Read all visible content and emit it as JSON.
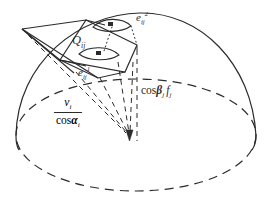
{
  "figure": {
    "background": "#ffffff",
    "stroke": "#2b2b2b",
    "width": 273,
    "height": 202
  },
  "labels": {
    "patch": {
      "base": "Q",
      "sub": "ij",
      "sup": ""
    },
    "element_upper": {
      "base": "e",
      "sub": "ij",
      "sup": "2"
    },
    "element_lower": {
      "base": "e",
      "sub": "ij",
      "sup": "1"
    },
    "flux": {
      "cos": "cos",
      "beta": "β",
      "beta_sub": "j",
      "f": "f",
      "f_sub": "j"
    },
    "fraction": {
      "num": "v",
      "num_sub": "i",
      "den_cos": "cos",
      "den_alpha": "α",
      "den_sub": "i"
    }
  },
  "geometry": {
    "dome_label": "dome-outline",
    "base_ellipse_label": "base-ellipse",
    "apex_label": "cone-apex",
    "center_label": "projection-center",
    "right_angle_markers": 2,
    "dashed_rays": 5
  },
  "colors": {
    "ink": "#2b2b2b",
    "ink_light": "#3a3a3a",
    "paper": "#ffffff"
  }
}
